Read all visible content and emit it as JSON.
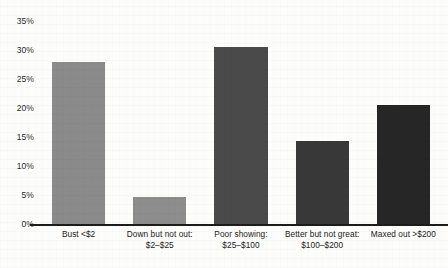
{
  "chart_data": {
    "type": "bar",
    "title": "",
    "subtitle": "",
    "xlabel": "",
    "ylabel": "",
    "ylim": [
      0,
      35
    ],
    "grid": false,
    "legend": null,
    "y_ticks": [
      "0%",
      "5%",
      "10%",
      "15%",
      "20%",
      "25%",
      "30%",
      "35%"
    ],
    "y_tick_values": [
      0,
      5,
      10,
      15,
      20,
      25,
      30,
      35
    ],
    "categories": [
      "Bust <$2",
      "Down but not out: $2–$25",
      "Poor showing: $25–$100",
      "Better but not great: $100–$200",
      "Maxed out >$200"
    ],
    "category_lines": [
      {
        "line1": "Bust <$2",
        "line2": ""
      },
      {
        "line1": "Down but not out:",
        "line2": "$2–$25"
      },
      {
        "line1": "Poor showing:",
        "line2": "$25–$100"
      },
      {
        "line1": "Better but not great:",
        "line2": "$100–$200"
      },
      {
        "line1": "Maxed out >$200",
        "line2": ""
      }
    ],
    "values": [
      28.0,
      4.7,
      30.5,
      14.3,
      20.5
    ],
    "value_labels": [
      "28%",
      "4.7%",
      "30.5%",
      "14.3%",
      "20.5%"
    ],
    "bar_colors": [
      "#8a8a8a",
      "#8d8d8d",
      "#4a4a4a",
      "#383838",
      "#262626"
    ]
  },
  "colors": {
    "axis": "#1c1c1c",
    "text": "#212121",
    "background": "#fdfdfc"
  }
}
